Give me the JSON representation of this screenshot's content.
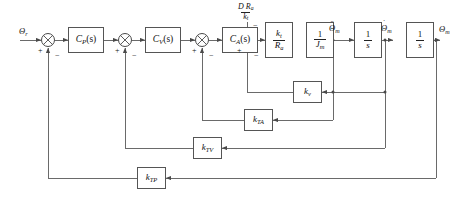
{
  "diagram": {
    "reference_input": "Θ",
    "reference_input_sub": "r",
    "output_label": "Θ",
    "output_label_sub": "m",
    "accel_label": "Θ",
    "accel_label_sub": "m",
    "accel_dots": "¨",
    "vel_label": "Θ",
    "vel_label_sub": "m",
    "vel_dots": "˙",
    "disturbance": {
      "numerator": "D R",
      "numerator_sub": "a",
      "denominator": "k",
      "denominator_sub": "t"
    }
  },
  "blocks": [
    {
      "id": "cp",
      "name": "position-controller-block",
      "kind": "plain",
      "label": "C",
      "sub": "P",
      "tail": "(s)"
    },
    {
      "id": "cv",
      "name": "velocity-controller-block",
      "kind": "plain",
      "label": "C",
      "sub": "V",
      "tail": "(s)"
    },
    {
      "id": "ca",
      "name": "acceleration-controller-block",
      "kind": "plain",
      "label": "C",
      "sub": "A",
      "tail": "(s)"
    },
    {
      "id": "kt",
      "name": "motor-torque-constant-block",
      "kind": "frac",
      "num": "k",
      "num_sub": "t",
      "den": "R",
      "den_sub": "a"
    },
    {
      "id": "jm",
      "name": "motor-inertia-block",
      "kind": "frac",
      "num": "1",
      "num_sub": "",
      "den": "J",
      "den_sub": "m"
    },
    {
      "id": "int1",
      "name": "first-integrator-block",
      "kind": "frac",
      "num": "1",
      "num_sub": "",
      "den": "s",
      "den_sub": ""
    },
    {
      "id": "int2",
      "name": "second-integrator-block",
      "kind": "frac",
      "num": "1",
      "num_sub": "",
      "den": "s",
      "den_sub": ""
    },
    {
      "id": "kv",
      "name": "back-emf-gain-block",
      "kind": "plain",
      "label": "k",
      "sub": "v",
      "tail": ""
    },
    {
      "id": "kta",
      "name": "acceleration-feedback-gain-block",
      "kind": "plain",
      "label": "k",
      "sub": "TA",
      "tail": ""
    },
    {
      "id": "ktv",
      "name": "velocity-feedback-gain-block",
      "kind": "plain",
      "label": "k",
      "sub": "TV",
      "tail": ""
    },
    {
      "id": "ktp",
      "name": "position-feedback-gain-block",
      "kind": "plain",
      "label": "k",
      "sub": "TP",
      "tail": ""
    }
  ],
  "summing_junctions": [
    {
      "id": "s1",
      "name": "position-error-summing-junction",
      "plus": "+",
      "minus": "−",
      "top": ""
    },
    {
      "id": "s2",
      "name": "velocity-error-summing-junction",
      "plus": "+",
      "minus": "−",
      "top": ""
    },
    {
      "id": "s3",
      "name": "acceleration-error-summing-junction",
      "plus": "+",
      "minus": "−",
      "top": ""
    },
    {
      "id": "s4",
      "name": "torque-disturbance-summing-junction",
      "plus": "+",
      "minus": "−",
      "top": "−"
    }
  ],
  "colors": {
    "line": "#6a6a6a",
    "block_border": "#555555",
    "text": "#111111",
    "background": "#ffffff"
  }
}
